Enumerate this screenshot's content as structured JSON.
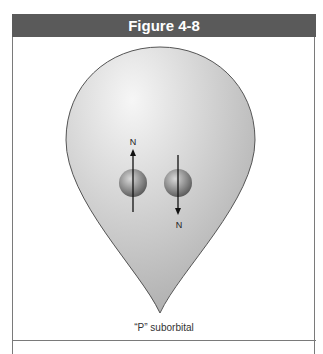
{
  "figure": {
    "title": "Figure 4-8",
    "caption": "“P” suborbital",
    "labels": {
      "electron_left_pole": "N",
      "electron_right_pole": "N"
    },
    "colors": {
      "header_bg": "#5a5a5a",
      "orbital_fill_light": "#f4f4f4",
      "orbital_fill_dark": "#b5b5b5",
      "frame": "#7a7a7a"
    }
  }
}
